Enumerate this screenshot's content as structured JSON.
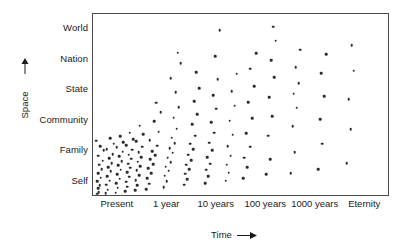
{
  "chart_data": {
    "type": "scatter",
    "title": "",
    "xlabel": "Time",
    "ylabel": "Space",
    "xlabel_arrow": "→",
    "ylabel_arrow": "↑",
    "grid": false,
    "legend": "none",
    "marker_color": "#2b2b2b",
    "frame_color": "#4a4a4a",
    "x_categories": [
      "Present",
      "1 year",
      "10 years",
      "100 years",
      "1000 years",
      "Eternity"
    ],
    "y_categories": [
      "Self",
      "Family",
      "Community",
      "State",
      "Nation",
      "World"
    ],
    "x_axis_note": "logarithmic time scale from Present to Eternity",
    "y_axis_note": "ordinal scale of spatial scope from Self to World",
    "xlim": [
      0,
      6
    ],
    "ylim": [
      0,
      6
    ],
    "n_points": 168,
    "points": [
      {
        "x": 0.08,
        "y": 0.04
      },
      {
        "x": 0.12,
        "y": 0.1
      },
      {
        "x": 0.1,
        "y": 0.22
      },
      {
        "x": 0.14,
        "y": 0.32
      },
      {
        "x": 0.09,
        "y": 0.46
      },
      {
        "x": 0.16,
        "y": 0.58
      },
      {
        "x": 0.11,
        "y": 0.72
      },
      {
        "x": 0.18,
        "y": 0.86
      },
      {
        "x": 0.13,
        "y": 1.0
      },
      {
        "x": 0.2,
        "y": 1.14
      },
      {
        "x": 0.1,
        "y": 1.3
      },
      {
        "x": 0.22,
        "y": 1.48
      },
      {
        "x": 0.15,
        "y": 1.62
      },
      {
        "x": 0.07,
        "y": 1.8
      },
      {
        "x": 0.26,
        "y": 0.06
      },
      {
        "x": 0.3,
        "y": 0.18
      },
      {
        "x": 0.27,
        "y": 0.34
      },
      {
        "x": 0.34,
        "y": 0.48
      },
      {
        "x": 0.29,
        "y": 0.62
      },
      {
        "x": 0.36,
        "y": 0.78
      },
      {
        "x": 0.31,
        "y": 0.92
      },
      {
        "x": 0.38,
        "y": 1.06
      },
      {
        "x": 0.33,
        "y": 1.22
      },
      {
        "x": 0.4,
        "y": 1.36
      },
      {
        "x": 0.28,
        "y": 1.52
      },
      {
        "x": 0.42,
        "y": 1.7
      },
      {
        "x": 0.35,
        "y": 1.88
      },
      {
        "x": 0.46,
        "y": 0.08
      },
      {
        "x": 0.5,
        "y": 0.24
      },
      {
        "x": 0.47,
        "y": 0.4
      },
      {
        "x": 0.54,
        "y": 0.54
      },
      {
        "x": 0.49,
        "y": 0.68
      },
      {
        "x": 0.56,
        "y": 0.84
      },
      {
        "x": 0.51,
        "y": 0.98
      },
      {
        "x": 0.58,
        "y": 1.12
      },
      {
        "x": 0.53,
        "y": 1.28
      },
      {
        "x": 0.6,
        "y": 1.44
      },
      {
        "x": 0.48,
        "y": 1.58
      },
      {
        "x": 0.62,
        "y": 1.76
      },
      {
        "x": 0.55,
        "y": 1.94
      },
      {
        "x": 0.66,
        "y": 0.12
      },
      {
        "x": 0.7,
        "y": 0.28
      },
      {
        "x": 0.67,
        "y": 0.44
      },
      {
        "x": 0.74,
        "y": 0.6
      },
      {
        "x": 0.69,
        "y": 0.76
      },
      {
        "x": 0.76,
        "y": 0.9
      },
      {
        "x": 0.71,
        "y": 1.04
      },
      {
        "x": 0.78,
        "y": 1.2
      },
      {
        "x": 0.73,
        "y": 1.34
      },
      {
        "x": 0.8,
        "y": 1.5
      },
      {
        "x": 0.68,
        "y": 1.66
      },
      {
        "x": 0.82,
        "y": 1.84
      },
      {
        "x": 0.75,
        "y": 2.06
      },
      {
        "x": 0.86,
        "y": 0.16
      },
      {
        "x": 0.9,
        "y": 0.32
      },
      {
        "x": 0.87,
        "y": 0.5
      },
      {
        "x": 0.94,
        "y": 0.66
      },
      {
        "x": 0.89,
        "y": 0.82
      },
      {
        "x": 0.96,
        "y": 0.96
      },
      {
        "x": 0.91,
        "y": 1.1
      },
      {
        "x": 0.98,
        "y": 1.26
      },
      {
        "x": 0.93,
        "y": 1.42
      },
      {
        "x": 1.0,
        "y": 1.6
      },
      {
        "x": 0.88,
        "y": 1.78
      },
      {
        "x": 1.02,
        "y": 2.02
      },
      {
        "x": 0.95,
        "y": 2.3
      },
      {
        "x": 1.08,
        "y": 0.2
      },
      {
        "x": 1.14,
        "y": 0.38
      },
      {
        "x": 1.1,
        "y": 0.56
      },
      {
        "x": 1.18,
        "y": 0.72
      },
      {
        "x": 1.12,
        "y": 0.88
      },
      {
        "x": 1.22,
        "y": 1.02
      },
      {
        "x": 1.16,
        "y": 1.18
      },
      {
        "x": 1.26,
        "y": 1.32
      },
      {
        "x": 1.2,
        "y": 1.46
      },
      {
        "x": 1.3,
        "y": 1.64
      },
      {
        "x": 1.15,
        "y": 1.82
      },
      {
        "x": 1.34,
        "y": 2.1
      },
      {
        "x": 1.24,
        "y": 2.44
      },
      {
        "x": 1.38,
        "y": 2.74
      },
      {
        "x": 1.28,
        "y": 3.06
      },
      {
        "x": 1.44,
        "y": 0.26
      },
      {
        "x": 1.5,
        "y": 0.46
      },
      {
        "x": 1.46,
        "y": 0.64
      },
      {
        "x": 1.54,
        "y": 0.8
      },
      {
        "x": 1.48,
        "y": 0.94
      },
      {
        "x": 1.58,
        "y": 1.08
      },
      {
        "x": 1.52,
        "y": 1.24
      },
      {
        "x": 1.62,
        "y": 1.4
      },
      {
        "x": 1.56,
        "y": 1.56
      },
      {
        "x": 1.66,
        "y": 1.72
      },
      {
        "x": 1.6,
        "y": 1.9
      },
      {
        "x": 1.7,
        "y": 2.2
      },
      {
        "x": 1.64,
        "y": 2.56
      },
      {
        "x": 1.74,
        "y": 2.92
      },
      {
        "x": 1.68,
        "y": 3.4
      },
      {
        "x": 1.58,
        "y": 3.88
      },
      {
        "x": 1.78,
        "y": 4.36
      },
      {
        "x": 1.72,
        "y": 4.72
      },
      {
        "x": 1.86,
        "y": 0.34
      },
      {
        "x": 1.92,
        "y": 0.52
      },
      {
        "x": 1.88,
        "y": 0.7
      },
      {
        "x": 1.96,
        "y": 0.86
      },
      {
        "x": 1.9,
        "y": 1.0
      },
      {
        "x": 2.0,
        "y": 1.16
      },
      {
        "x": 1.94,
        "y": 1.34
      },
      {
        "x": 2.04,
        "y": 1.52
      },
      {
        "x": 1.98,
        "y": 1.7
      },
      {
        "x": 2.08,
        "y": 1.96
      },
      {
        "x": 2.02,
        "y": 2.34
      },
      {
        "x": 2.12,
        "y": 2.68
      },
      {
        "x": 2.06,
        "y": 3.1
      },
      {
        "x": 2.16,
        "y": 3.54
      },
      {
        "x": 2.1,
        "y": 4.08
      },
      {
        "x": 2.28,
        "y": 0.4
      },
      {
        "x": 2.34,
        "y": 0.62
      },
      {
        "x": 2.3,
        "y": 0.84
      },
      {
        "x": 2.38,
        "y": 1.04
      },
      {
        "x": 2.32,
        "y": 1.26
      },
      {
        "x": 2.42,
        "y": 1.48
      },
      {
        "x": 2.36,
        "y": 1.74
      },
      {
        "x": 2.46,
        "y": 2.06
      },
      {
        "x": 2.4,
        "y": 2.42
      },
      {
        "x": 2.5,
        "y": 2.86
      },
      {
        "x": 2.44,
        "y": 3.3
      },
      {
        "x": 2.54,
        "y": 3.84
      },
      {
        "x": 2.48,
        "y": 4.6
      },
      {
        "x": 2.58,
        "y": 5.46
      },
      {
        "x": 2.7,
        "y": 0.48
      },
      {
        "x": 2.76,
        "y": 0.74
      },
      {
        "x": 2.72,
        "y": 1.0
      },
      {
        "x": 2.8,
        "y": 1.3
      },
      {
        "x": 2.74,
        "y": 1.62
      },
      {
        "x": 2.84,
        "y": 2.0
      },
      {
        "x": 2.78,
        "y": 2.46
      },
      {
        "x": 2.88,
        "y": 2.96
      },
      {
        "x": 2.82,
        "y": 3.44
      },
      {
        "x": 2.92,
        "y": 4.02
      },
      {
        "x": 3.06,
        "y": 0.56
      },
      {
        "x": 3.14,
        "y": 0.92
      },
      {
        "x": 3.08,
        "y": 1.24
      },
      {
        "x": 3.2,
        "y": 1.6
      },
      {
        "x": 3.12,
        "y": 2.04
      },
      {
        "x": 3.24,
        "y": 2.54
      },
      {
        "x": 3.16,
        "y": 3.08
      },
      {
        "x": 3.28,
        "y": 3.6
      },
      {
        "x": 3.2,
        "y": 4.18
      },
      {
        "x": 3.32,
        "y": 4.7
      },
      {
        "x": 3.52,
        "y": 0.68
      },
      {
        "x": 3.6,
        "y": 1.18
      },
      {
        "x": 3.56,
        "y": 1.96
      },
      {
        "x": 3.64,
        "y": 2.62
      },
      {
        "x": 3.58,
        "y": 3.24
      },
      {
        "x": 3.68,
        "y": 3.9
      },
      {
        "x": 3.62,
        "y": 4.46
      },
      {
        "x": 3.72,
        "y": 5.12
      },
      {
        "x": 3.66,
        "y": 5.58
      },
      {
        "x": 4.02,
        "y": 0.72
      },
      {
        "x": 4.1,
        "y": 1.42
      },
      {
        "x": 4.06,
        "y": 2.28
      },
      {
        "x": 4.14,
        "y": 2.9
      },
      {
        "x": 4.08,
        "y": 3.36
      },
      {
        "x": 4.18,
        "y": 3.7
      },
      {
        "x": 4.12,
        "y": 4.24
      },
      {
        "x": 4.22,
        "y": 4.82
      },
      {
        "x": 4.58,
        "y": 0.86
      },
      {
        "x": 4.66,
        "y": 1.7
      },
      {
        "x": 4.62,
        "y": 2.52
      },
      {
        "x": 4.7,
        "y": 3.28
      },
      {
        "x": 4.64,
        "y": 4.04
      },
      {
        "x": 4.74,
        "y": 4.66
      },
      {
        "x": 5.16,
        "y": 1.06
      },
      {
        "x": 5.24,
        "y": 2.18
      },
      {
        "x": 5.2,
        "y": 3.18
      },
      {
        "x": 5.3,
        "y": 4.12
      },
      {
        "x": 5.26,
        "y": 4.96
      }
    ]
  }
}
